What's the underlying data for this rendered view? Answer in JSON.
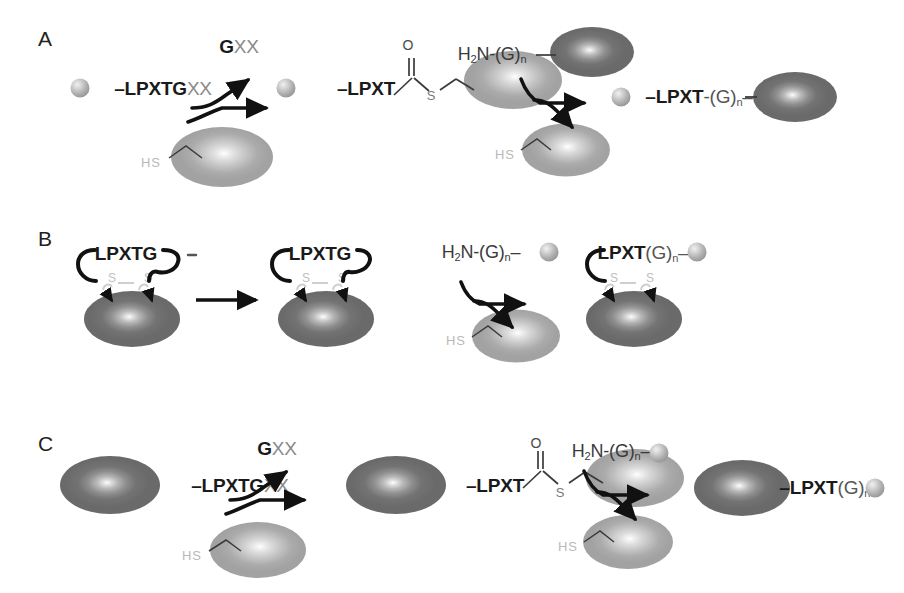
{
  "figure": {
    "type": "scientific-diagram",
    "background_color": "#ffffff",
    "colors": {
      "sequence_bold": "#1a1a1a",
      "sequence_faint": "#8a8a8a",
      "hs_label": "#b9b9b9",
      "arrow": "#111111",
      "ellipse_dark": "#737373",
      "ellipse_light": "#b8b8b8",
      "sphere": "#a8a8a8"
    }
  },
  "panels": [
    {
      "id": "A",
      "label": "A",
      "reagent_label": {
        "bold": "G",
        "plain": "XX"
      },
      "substrate": {
        "bold": "LPXTG",
        "faint": "XX"
      },
      "acyl_intermediate": {
        "bold": "LPXT",
        "carbonyl": "O",
        "thioester": "S"
      },
      "nucleophile": {
        "prefix": "H",
        "sub1": "2",
        "mid": "N-(G)",
        "sub2": "n"
      },
      "enzyme_thiol": "HS",
      "product": {
        "bold": "LPXT",
        "link": "-(G)",
        "sub": "n"
      }
    },
    {
      "id": "B",
      "label": "B",
      "substrate": {
        "bold": "LPXTG"
      },
      "intermediate": {
        "bold": "LPXTG"
      },
      "disulfide": {
        "left": "S",
        "right": "S"
      },
      "nucleophile": {
        "prefix": "H",
        "sub1": "2",
        "mid": "N-(G)",
        "sub2": "n"
      },
      "enzyme_thiol": "HS",
      "product": {
        "bold": "LPXT",
        "link": "(G)",
        "sub": "n"
      }
    },
    {
      "id": "C",
      "label": "C",
      "reagent_label": {
        "bold": "G",
        "plain": "XX"
      },
      "substrate": {
        "bold": "LPXTG",
        "faint": "XX"
      },
      "acyl_intermediate": {
        "bold": "LPXT",
        "carbonyl": "O",
        "thioester": "S"
      },
      "nucleophile": {
        "prefix": "H",
        "sub1": "2",
        "mid": "N-(G)",
        "sub2": "n"
      },
      "enzyme_thiol": "HS",
      "product": {
        "bold": "LPXT",
        "link": "(G)",
        "sub": "n"
      }
    }
  ]
}
